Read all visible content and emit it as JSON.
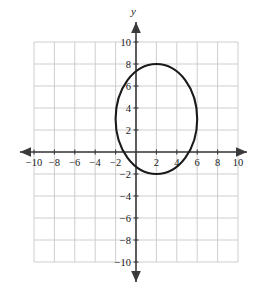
{
  "chart_data": {
    "type": "scatter",
    "title": "",
    "subtitle": "",
    "xlabel": "",
    "ylabel": "y",
    "xlim": [
      -11.5,
      11.5
    ],
    "ylim": [
      -11.5,
      11.5
    ],
    "grid": true,
    "grid_range": [
      -10,
      10
    ],
    "grid_step": 2,
    "legend": "none",
    "x_ticks": [
      -10,
      -8,
      -6,
      -4,
      -2,
      2,
      4,
      6,
      8,
      10
    ],
    "x_tick_labels": [
      "-10",
      "-8",
      "-6",
      "-4",
      "-2",
      "2",
      "4",
      "6",
      "8",
      "10"
    ],
    "y_ticks": [
      10,
      8,
      6,
      4,
      2,
      -2,
      -4,
      -6,
      -8,
      -10
    ],
    "y_tick_labels": [
      "10",
      "8",
      "6",
      "4",
      "2",
      "-2",
      "-4",
      "-6",
      "-8",
      "-10"
    ],
    "series": [
      {
        "name": "ellipse",
        "type": "ellipse",
        "center": [
          2,
          3
        ],
        "semi_axis_x": 4,
        "semi_axis_y": 5,
        "x_intercept_range": [
          -2,
          6
        ],
        "y_intercept_range": [
          -2,
          8
        ],
        "vertices": [
          [
            2,
            8
          ],
          [
            2,
            -2
          ],
          [
            -2,
            3
          ],
          [
            6,
            3
          ]
        ],
        "color": "#1a1a1a",
        "line_width": 2.1,
        "filled": false
      }
    ],
    "annotations": []
  },
  "axes": {
    "y_axis_name": "y",
    "x_axis_name": "",
    "origin_label": "",
    "arrow_heads": [
      "up",
      "down",
      "left",
      "right"
    ]
  },
  "colors": {
    "grid_line": "#c8c8cc",
    "axis_line": "#3a3a3a",
    "curve": "#1a1a1a",
    "tick_label": "#1a1a1a",
    "background": "#ffffff"
  }
}
